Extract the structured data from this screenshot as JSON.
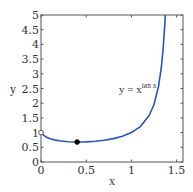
{
  "chart_data": {
    "type": "line",
    "title": "",
    "xlabel": "x",
    "ylabel": "y",
    "xlim": [
      0,
      1.5708
    ],
    "ylim": [
      0,
      5
    ],
    "xticks": [
      0,
      0.5,
      1,
      1.5
    ],
    "xtick_labels": [
      "0",
      "0.5",
      "1",
      "1.5"
    ],
    "yticks": [
      0,
      0.5,
      1,
      1.5,
      2,
      2.5,
      3,
      3.5,
      4,
      4.5,
      5
    ],
    "ytick_labels": [
      "0",
      "0.5",
      "1",
      "1.5",
      "2",
      "2.5",
      "3",
      "3.5",
      "4",
      "4.5",
      "5"
    ],
    "grid": false,
    "legend": null,
    "series": [
      {
        "name": "y = x^tan x",
        "color": "#2a52be",
        "x": [
          0.0,
          0.01,
          0.05,
          0.1,
          0.15,
          0.2,
          0.3,
          0.4,
          0.5,
          0.6,
          0.7,
          0.8,
          0.9,
          1.0,
          1.1,
          1.2,
          1.25,
          1.3,
          1.33,
          1.35,
          1.37,
          1.38
        ],
        "y": [
          1.0,
          0.955,
          0.861,
          0.794,
          0.752,
          0.722,
          0.689,
          0.679,
          0.685,
          0.705,
          0.74,
          0.795,
          0.876,
          1.0,
          1.206,
          1.598,
          1.957,
          2.573,
          3.19,
          3.81,
          4.7,
          5.3
        ]
      }
    ],
    "points": [
      {
        "name": "open-point",
        "x": 0,
        "y": 1,
        "filled": false
      },
      {
        "name": "minimum-point",
        "x": 0.4,
        "y": 0.679,
        "filled": true
      }
    ],
    "annotations": [
      {
        "text_base": "y = x",
        "text_sup": "tan x",
        "x": 0.86,
        "y": 2.45
      }
    ]
  },
  "labels": {
    "x_axis": "x",
    "y_axis": "y",
    "annotation_base": "y = x",
    "annotation_sup": "tan x"
  }
}
